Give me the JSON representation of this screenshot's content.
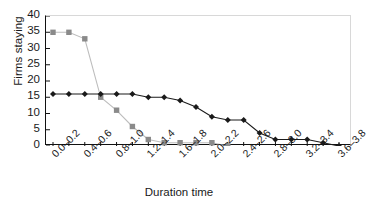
{
  "chart_data": {
    "type": "line",
    "title": "",
    "xlabel": "Duration time",
    "ylabel": "Firms staying",
    "ylim": [
      0,
      40
    ],
    "ytick_values": [
      0,
      5,
      10,
      15,
      20,
      25,
      30,
      35,
      40
    ],
    "grid": false,
    "legend": "none",
    "categories": [
      "0.0–0.2",
      "0.2–0.4",
      "0.4–0.6",
      "0.6–0.8",
      "0.8–1.0",
      "1.0–1.2",
      "1.2–1.4",
      "1.4–1.6",
      "1.6–1.8",
      "1.8–2.0",
      "2.0–2.2",
      "2.2–2.4",
      "2.4–2.6",
      "2.6–2.8",
      "2.8–3.0",
      "3.0–3.2",
      "3.2–3.4",
      "3.4–3.6",
      "3.6–3.8"
    ],
    "visible_tick_labels": [
      "0.0–0.2",
      "0.4–0.6",
      "0.8–1.0",
      "1.2–1.4",
      "1.6–1.8",
      "2.0–2.2",
      "2.4–2.6",
      "2.8–3.0",
      "3.2–3.4",
      "3.6–3.8"
    ],
    "visible_tick_indices": [
      0,
      2,
      4,
      6,
      8,
      10,
      12,
      14,
      16,
      18
    ],
    "series": [
      {
        "name": "series-squares",
        "marker": "square",
        "color": "#8a8a8a",
        "line_color": "#bdbdbd",
        "values": [
          35,
          35,
          33,
          15,
          11,
          6,
          2,
          1,
          1,
          1,
          1,
          0,
          null,
          null,
          null,
          null,
          null,
          null,
          null
        ]
      },
      {
        "name": "series-diamonds",
        "marker": "diamond",
        "color": "#1a1a1a",
        "line_color": "#1a1a1a",
        "values": [
          16,
          16,
          16,
          16,
          16,
          16,
          15,
          15,
          14,
          12,
          9,
          8,
          8,
          4,
          2,
          2,
          2,
          1,
          0
        ]
      }
    ]
  }
}
